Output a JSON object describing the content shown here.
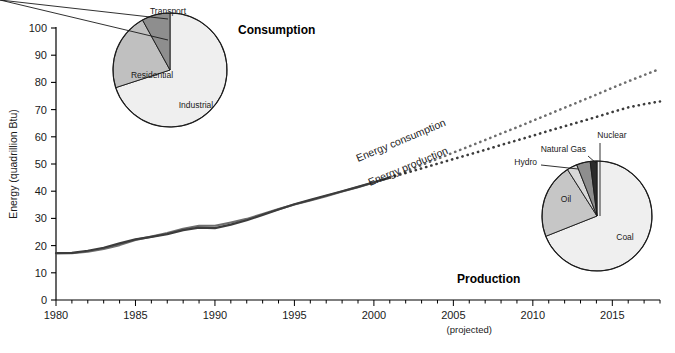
{
  "caption": {
    "marker": "D",
    "text": "Energy consumption and production in China"
  },
  "chart_data": {
    "type": "line",
    "title": "",
    "xlabel": "",
    "ylabel": "Energy (quadrillion Btu)",
    "xlim": [
      1980,
      2018
    ],
    "ylim": [
      0,
      100
    ],
    "ytick_step": 10,
    "xtick_step": 5,
    "grid": false,
    "projection_note": "(projected)",
    "projection_start_year": 2001,
    "xticks": [
      "1980",
      "1985",
      "1990",
      "1995",
      "2000",
      "2005",
      "2010",
      "2015"
    ],
    "xtick_values": [
      1980,
      1985,
      1990,
      1995,
      2000,
      2005,
      2010,
      2015
    ],
    "yticks": [
      "0",
      "10",
      "20",
      "30",
      "40",
      "50",
      "60",
      "70",
      "80",
      "90",
      "100"
    ],
    "ytick_values": [
      0,
      10,
      20,
      30,
      40,
      50,
      60,
      70,
      80,
      90,
      100
    ],
    "x": [
      1980,
      1981,
      1982,
      1983,
      1984,
      1985,
      1986,
      1987,
      1988,
      1989,
      1990,
      1991,
      1992,
      1993,
      1994,
      1995,
      1996,
      1997,
      1998,
      1999,
      2000,
      2001
    ],
    "x_projected": [
      2001,
      2002,
      2003,
      2004,
      2005,
      2006,
      2007,
      2008,
      2009,
      2010,
      2011,
      2012,
      2013,
      2014,
      2015,
      2016,
      2017,
      2018
    ],
    "series": [
      {
        "name": "Energy consumption",
        "label": "Energy consumption",
        "color": "#6e6e6e",
        "style": "solid-then-dotted",
        "values": [
          17.2,
          17.2,
          17.8,
          18.8,
          20.2,
          22.1,
          23.3,
          24.6,
          26.2,
          27.3,
          27.3,
          28.5,
          29.8,
          31.6,
          33.4,
          35.1,
          36.6,
          38.2,
          39.9,
          41.5,
          43.2,
          45.0
        ],
        "values_projected": [
          45.0,
          47.3,
          49.6,
          51.9,
          54.2,
          56.5,
          58.8,
          61.2,
          63.5,
          65.9,
          68.3,
          70.7,
          73.1,
          75.5,
          78.0,
          80.4,
          82.7,
          85.0
        ]
      },
      {
        "name": "Energy production",
        "label": "Energy production",
        "color": "#3c3c3c",
        "style": "solid-then-dotted",
        "values": [
          17.2,
          17.3,
          18.1,
          19.2,
          20.8,
          22.3,
          23.2,
          24.2,
          25.7,
          26.6,
          26.4,
          27.7,
          29.3,
          31.3,
          33.3,
          35.2,
          36.8,
          38.4,
          40.0,
          41.6,
          43.3,
          45.0
        ],
        "values_projected": [
          45.0,
          46.7,
          48.4,
          50.1,
          51.8,
          53.5,
          55.2,
          57.0,
          58.7,
          60.4,
          62.2,
          63.9,
          65.6,
          67.3,
          69.1,
          70.8,
          72.0,
          73.0
        ]
      }
    ],
    "pies": [
      {
        "name": "consumption-pie",
        "title": "Consumption",
        "slices": [
          {
            "label": "Industrial",
            "value": 70,
            "color": "#efefef"
          },
          {
            "label": "Residential",
            "value": 22,
            "color": "#c0c0c0"
          },
          {
            "label": "Transport",
            "value": 8,
            "color": "#8e8e8e"
          }
        ]
      },
      {
        "name": "production-pie",
        "title": "Production",
        "slices": [
          {
            "label": "Coal",
            "value": 69,
            "color": "#efefef"
          },
          {
            "label": "Oil",
            "value": 22,
            "color": "#c6c6c6"
          },
          {
            "label": "Hydro",
            "value": 3,
            "color": "#d8d8d8"
          },
          {
            "label": "Natural Gas",
            "value": 4,
            "color": "#8e8e8e"
          },
          {
            "label": "Nuclear",
            "value": 2,
            "color": "#2b2b2b"
          }
        ]
      }
    ]
  }
}
